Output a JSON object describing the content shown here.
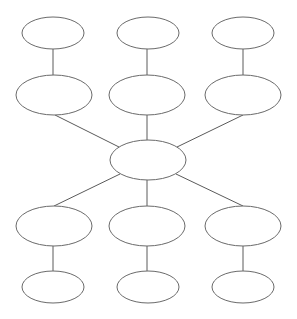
{
  "diagram": {
    "type": "hub-and-spoke organizer",
    "colors": {
      "stroke": "#6a6a6a",
      "fill": "#ffffff",
      "background": "#ffffff"
    },
    "nodes": [
      {
        "id": "center",
        "label": "",
        "cx": 148,
        "cy": 160,
        "rx": 38,
        "ry": 20
      },
      {
        "id": "upper-left-inner",
        "label": "",
        "cx": 54,
        "cy": 95,
        "rx": 38,
        "ry": 20
      },
      {
        "id": "upper-middle-inner",
        "label": "",
        "cx": 147,
        "cy": 95,
        "rx": 38,
        "ry": 20
      },
      {
        "id": "upper-right-inner",
        "label": "",
        "cx": 243,
        "cy": 95,
        "rx": 38,
        "ry": 20
      },
      {
        "id": "upper-left-outer",
        "label": "",
        "cx": 53,
        "cy": 33,
        "rx": 31,
        "ry": 16
      },
      {
        "id": "upper-middle-outer",
        "label": "",
        "cx": 148,
        "cy": 33,
        "rx": 31,
        "ry": 16
      },
      {
        "id": "upper-right-outer",
        "label": "",
        "cx": 243,
        "cy": 33,
        "rx": 31,
        "ry": 16
      },
      {
        "id": "lower-left-inner",
        "label": "",
        "cx": 54,
        "cy": 226,
        "rx": 38,
        "ry": 20
      },
      {
        "id": "lower-middle-inner",
        "label": "",
        "cx": 147,
        "cy": 226,
        "rx": 38,
        "ry": 20
      },
      {
        "id": "lower-right-inner",
        "label": "",
        "cx": 243,
        "cy": 226,
        "rx": 38,
        "ry": 20
      },
      {
        "id": "lower-left-outer",
        "label": "",
        "cx": 53,
        "cy": 287,
        "rx": 31,
        "ry": 16
      },
      {
        "id": "lower-middle-outer",
        "label": "",
        "cx": 148,
        "cy": 287,
        "rx": 31,
        "ry": 16
      },
      {
        "id": "lower-right-outer",
        "label": "",
        "cx": 243,
        "cy": 287,
        "rx": 31,
        "ry": 16
      }
    ],
    "edges": [
      {
        "from": "center",
        "to": "upper-left-inner"
      },
      {
        "from": "center",
        "to": "upper-middle-inner"
      },
      {
        "from": "center",
        "to": "upper-right-inner"
      },
      {
        "from": "center",
        "to": "lower-left-inner"
      },
      {
        "from": "center",
        "to": "lower-middle-inner"
      },
      {
        "from": "center",
        "to": "lower-right-inner"
      },
      {
        "from": "upper-left-inner",
        "to": "upper-left-outer"
      },
      {
        "from": "upper-middle-inner",
        "to": "upper-middle-outer"
      },
      {
        "from": "upper-right-inner",
        "to": "upper-right-outer"
      },
      {
        "from": "lower-left-inner",
        "to": "lower-left-outer"
      },
      {
        "from": "lower-middle-inner",
        "to": "lower-middle-outer"
      },
      {
        "from": "lower-right-inner",
        "to": "lower-right-outer"
      }
    ]
  }
}
